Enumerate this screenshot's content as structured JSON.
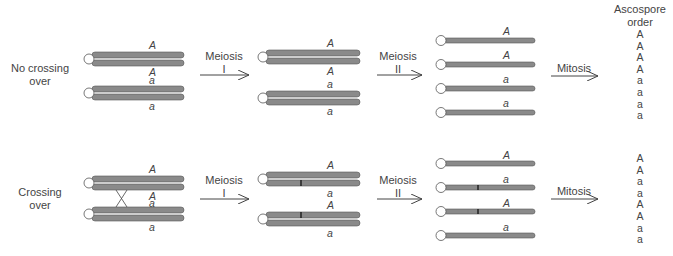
{
  "rows": [
    {
      "label": "No crossing\nover",
      "label_lines": [
        "No crossing",
        "over"
      ],
      "meiosis1": {
        "label_top": "Meiosis",
        "label_bottom": "I"
      },
      "meiosis2": {
        "label_top": "Meiosis",
        "label_bottom": "II"
      },
      "mitosis": {
        "label": "Mitosis"
      },
      "stage0_alleles": [
        "A",
        "A",
        "a",
        "a"
      ],
      "stage1_alleles": [
        "A",
        "A",
        "a",
        "a"
      ],
      "stage2_alleles": [
        "A",
        "A",
        "a",
        "a"
      ],
      "spores": [
        "A",
        "A",
        "A",
        "A",
        "a",
        "a",
        "a",
        "a"
      ]
    },
    {
      "label_lines": [
        "Crossing",
        "over"
      ],
      "meiosis1": {
        "label_top": "Meiosis",
        "label_bottom": "I"
      },
      "meiosis2": {
        "label_top": "Meiosis",
        "label_bottom": "II"
      },
      "mitosis": {
        "label": "Mitosis"
      },
      "stage0_alleles": [
        "A",
        "A",
        "a",
        "a"
      ],
      "stage1_alleles": [
        "A",
        "a",
        "A",
        "a"
      ],
      "stage2_alleles": [
        "A",
        "a",
        "A",
        "a"
      ],
      "spores": [
        "A",
        "A",
        "a",
        "a",
        "A",
        "A",
        "a",
        "a"
      ]
    }
  ],
  "header": {
    "ascospore_line1": "Ascospore",
    "ascospore_line2": "order"
  },
  "colors": {
    "chromatid": "#8a8a8a",
    "outline": "#555555",
    "centromere": "#ffffff"
  }
}
